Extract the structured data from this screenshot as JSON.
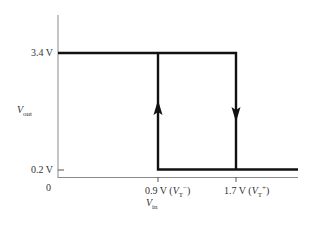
{
  "diagram": {
    "type": "hysteresis-transfer-curve",
    "y_axis": {
      "label_main": "V",
      "label_sub": "out",
      "ticks": [
        {
          "label": "3.4 V",
          "value": 3.4
        },
        {
          "label": "0.2 V",
          "value": 0.2
        }
      ]
    },
    "x_axis": {
      "label_main": "V",
      "label_sub": "in",
      "origin_label": "0",
      "ticks": [
        {
          "value_label": "0.9 V (",
          "sym": "V",
          "sub": "T",
          "sup": "−",
          "close": ")",
          "value": 0.9
        },
        {
          "value_label": "1.7 V (",
          "sym": "V",
          "sub": "T",
          "sup": "+",
          "close": ")",
          "value": 1.7
        }
      ]
    },
    "levels": {
      "high": "3.4 V",
      "low": "0.2 V"
    },
    "thresholds": {
      "lower": "0.9 V",
      "upper": "1.7 V"
    },
    "arrows": [
      {
        "position": "0.9 V",
        "direction": "up"
      },
      {
        "position": "1.7 V",
        "direction": "down"
      }
    ],
    "colors": {
      "curve": "#111111",
      "axis": "#888888"
    }
  }
}
